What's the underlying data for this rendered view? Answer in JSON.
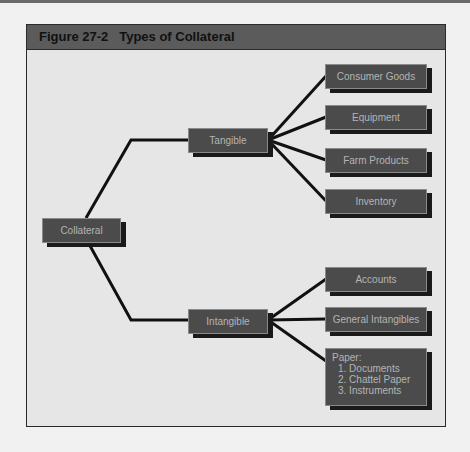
{
  "figure": {
    "title": "Figure 27-2   Types of Collateral"
  },
  "colors": {
    "box_fill": "#4b4b4b",
    "box_text": "#b4b4b4",
    "title_bar": "#5b5b5b",
    "panel_bg": "#e6e6e6",
    "line": "#111111"
  },
  "diagram": {
    "root": {
      "label": "Collateral"
    },
    "branches": [
      {
        "label": "Tangible",
        "children": [
          {
            "label": "Consumer Goods"
          },
          {
            "label": "Equipment"
          },
          {
            "label": "Farm Products"
          },
          {
            "label": "Inventory"
          }
        ]
      },
      {
        "label": "Intangible",
        "children": [
          {
            "label": "Accounts"
          },
          {
            "label": "General Intangibles"
          },
          {
            "label": "Paper:",
            "items": [
              "1. Documents",
              "2. Chattel Paper",
              "3. Instruments"
            ]
          }
        ]
      }
    ]
  }
}
